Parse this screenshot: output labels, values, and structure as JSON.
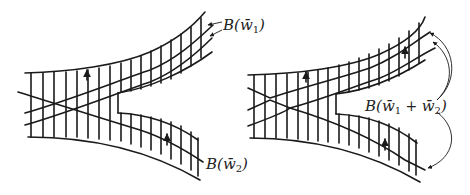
{
  "figure": {
    "left_panel": {
      "labels": {
        "top": {
          "prefix": "B(",
          "var": "w̄",
          "sub": "1",
          "suffix": ")"
        },
        "bottom": {
          "prefix": "B(",
          "var": "w̄",
          "sub": "2",
          "suffix": ")"
        }
      }
    },
    "right_panel": {
      "labels": {
        "combined": {
          "prefix": "B(",
          "var1": "w̄",
          "sub1": "1",
          "plus": " + ",
          "var2": "w̄",
          "sub2": "2",
          "suffix": ")"
        }
      }
    },
    "colors": {
      "ink": "#1a1a1a",
      "background": "#ffffff"
    }
  }
}
